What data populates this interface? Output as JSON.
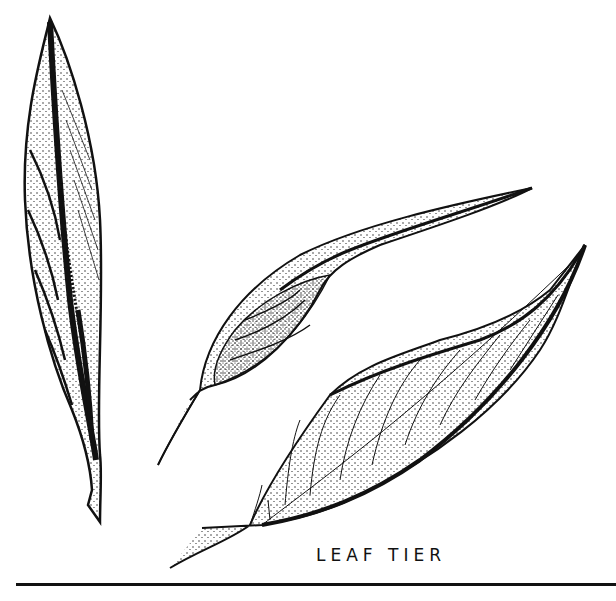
{
  "illustration": {
    "caption": "LEAF TIER",
    "subjects": [
      "rolled-leaf",
      "folded-leaf",
      "open-leaf"
    ],
    "style": "pen-and-ink stipple drawing",
    "ink_color": "#111111",
    "paper_color": "#ffffff"
  }
}
